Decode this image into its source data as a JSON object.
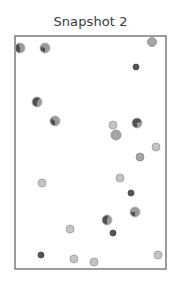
{
  "chart_data": {
    "type": "scatter",
    "title": "Snapshot 2",
    "xlabel": "",
    "ylabel": "",
    "axes_visible": false,
    "grid": false,
    "legend": null,
    "frame": {
      "x0": 15,
      "y0": 36,
      "x1": 166,
      "y1": 269,
      "color": "#5a5a5a"
    },
    "marker_styles": {
      "pie": {
        "fill": "#9a9a9a",
        "wedge": "#505050",
        "stroke": "#b0b0b0"
      },
      "light": {
        "fill": "#c4c4c4",
        "stroke": "#9a9a9a"
      },
      "medium": {
        "fill": "#a6a6a6",
        "stroke": "#8a8a8a"
      },
      "dot": {
        "fill": "#555555",
        "stroke": "#444444"
      }
    },
    "points": [
      {
        "x": 20,
        "y": 48,
        "r": 5,
        "style": "pie",
        "wedge": 0.45
      },
      {
        "x": 45,
        "y": 48,
        "r": 5,
        "style": "pie",
        "wedge": 0.3
      },
      {
        "x": 152,
        "y": 42,
        "r": 4.5,
        "style": "medium"
      },
      {
        "x": 136,
        "y": 67,
        "r": 3,
        "style": "dot"
      },
      {
        "x": 37,
        "y": 102,
        "r": 5,
        "style": "pie",
        "wedge": 0.6
      },
      {
        "x": 55,
        "y": 121,
        "r": 5,
        "style": "pie",
        "wedge": 0.35
      },
      {
        "x": 113,
        "y": 125,
        "r": 4,
        "style": "light"
      },
      {
        "x": 137,
        "y": 123,
        "r": 5,
        "style": "pie",
        "wedge": 0.7
      },
      {
        "x": 116,
        "y": 135,
        "r": 5,
        "style": "medium"
      },
      {
        "x": 156,
        "y": 147,
        "r": 4,
        "style": "light"
      },
      {
        "x": 140,
        "y": 157,
        "r": 4,
        "style": "medium"
      },
      {
        "x": 42,
        "y": 183,
        "r": 4,
        "style": "light"
      },
      {
        "x": 120,
        "y": 178,
        "r": 4,
        "style": "light"
      },
      {
        "x": 131,
        "y": 193,
        "r": 3,
        "style": "dot"
      },
      {
        "x": 135,
        "y": 212,
        "r": 5,
        "style": "pie",
        "wedge": 0.25
      },
      {
        "x": 107,
        "y": 220,
        "r": 5,
        "style": "pie",
        "wedge": 0.55
      },
      {
        "x": 113,
        "y": 233,
        "r": 3,
        "style": "dot"
      },
      {
        "x": 70,
        "y": 229,
        "r": 4,
        "style": "light"
      },
      {
        "x": 41,
        "y": 255,
        "r": 3,
        "style": "dot"
      },
      {
        "x": 74,
        "y": 259,
        "r": 4,
        "style": "light"
      },
      {
        "x": 94,
        "y": 262,
        "r": 4,
        "style": "light"
      },
      {
        "x": 158,
        "y": 255,
        "r": 4,
        "style": "light"
      }
    ]
  }
}
